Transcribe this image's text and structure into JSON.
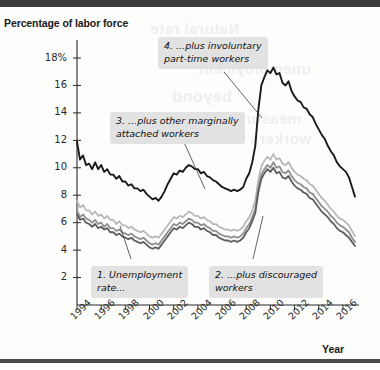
{
  "figure": {
    "y_axis_title": "Percentage of\nlabor force",
    "x_axis_title": "Year"
  },
  "annotations": [
    {
      "id": "callout-4",
      "text": "4. ...plus involuntary\npart-time workers"
    },
    {
      "id": "callout-3",
      "text": "3. ...plus other marginally\nattached workers"
    },
    {
      "id": "callout-1",
      "text": "1. Unemployment\nrate..."
    },
    {
      "id": "callout-2",
      "text": "2. ...plus discouraged\nworkers"
    }
  ],
  "chart_data": {
    "type": "line",
    "title": "",
    "subtitle": "",
    "xlabel": "Year",
    "ylabel": "Percentage of labor force",
    "xlim": [
      1994,
      2017
    ],
    "ylim": [
      0,
      19
    ],
    "yticks": [
      2,
      4,
      6,
      8,
      10,
      12,
      14,
      16,
      18
    ],
    "ytick_labels": [
      "2",
      "4",
      "6",
      "8",
      "10",
      "12",
      "14",
      "16",
      "18%"
    ],
    "xticks": [
      1994,
      1996,
      1998,
      2000,
      2002,
      2004,
      2006,
      2008,
      2010,
      2012,
      2014,
      2016
    ],
    "xtick_labels": [
      "1994",
      "1996",
      "1998",
      "2000",
      "2002",
      "2004",
      "2006",
      "2008",
      "2010",
      "2012",
      "2014",
      "2016"
    ],
    "grid": false,
    "legend": "annotations",
    "colors": {
      "u6": "#1a1a1a",
      "u5": "#b8b8b8",
      "u4": "#8f8f8f",
      "u3": "#5d5d5d"
    },
    "series": [
      {
        "name": "4. ...plus involuntary part-time workers",
        "key": "u6",
        "color": "#1a1a1a",
        "x": [
          1994.0,
          1994.25,
          1994.5,
          1994.75,
          1995.0,
          1995.25,
          1995.5,
          1995.75,
          1996.0,
          1996.25,
          1996.5,
          1996.75,
          1997.0,
          1997.25,
          1997.5,
          1997.75,
          1998.0,
          1998.25,
          1998.5,
          1998.75,
          1999.0,
          1999.25,
          1999.5,
          1999.75,
          2000.0,
          2000.25,
          2000.5,
          2000.75,
          2001.0,
          2001.25,
          2001.5,
          2001.75,
          2002.0,
          2002.25,
          2002.5,
          2002.75,
          2003.0,
          2003.25,
          2003.5,
          2003.75,
          2004.0,
          2004.25,
          2004.5,
          2004.75,
          2005.0,
          2005.25,
          2005.5,
          2005.75,
          2006.0,
          2006.25,
          2006.5,
          2006.75,
          2007.0,
          2007.25,
          2007.5,
          2007.75,
          2008.0,
          2008.25,
          2008.5,
          2008.75,
          2009.0,
          2009.25,
          2009.5,
          2009.75,
          2010.0,
          2010.25,
          2010.5,
          2010.75,
          2011.0,
          2011.25,
          2011.5,
          2011.75,
          2012.0,
          2012.25,
          2012.5,
          2012.75,
          2013.0,
          2013.25,
          2013.5,
          2013.75,
          2014.0,
          2014.25,
          2014.5,
          2014.75,
          2015.0,
          2015.25,
          2015.5,
          2015.75,
          2016.0,
          2016.25,
          2016.5,
          2016.75,
          2017.0
        ],
        "y": [
          11.9,
          10.6,
          10.9,
          10.2,
          10.3,
          9.9,
          10.4,
          9.9,
          10.2,
          9.7,
          9.9,
          9.5,
          9.5,
          9.2,
          9.4,
          9.0,
          9.0,
          8.7,
          8.8,
          8.5,
          8.5,
          8.3,
          8.4,
          8.1,
          7.9,
          7.7,
          7.8,
          7.6,
          7.9,
          8.3,
          8.8,
          9.2,
          9.6,
          9.5,
          9.8,
          9.7,
          10.0,
          10.2,
          10.1,
          9.9,
          9.9,
          9.6,
          9.7,
          9.4,
          9.3,
          9.1,
          9.0,
          8.8,
          8.6,
          8.5,
          8.4,
          8.3,
          8.4,
          8.3,
          8.4,
          8.6,
          9.2,
          9.6,
          10.4,
          11.6,
          14.2,
          16.0,
          16.6,
          17.1,
          16.9,
          17.3,
          16.8,
          16.9,
          16.2,
          16.0,
          16.3,
          15.6,
          15.2,
          14.9,
          14.8,
          14.4,
          14.3,
          13.9,
          13.7,
          13.2,
          12.8,
          12.4,
          12.1,
          11.6,
          11.2,
          10.9,
          10.4,
          10.1,
          9.9,
          9.7,
          9.3,
          8.6,
          7.9
        ]
      },
      {
        "name": "3. ...plus other marginally attached workers",
        "key": "u5",
        "color": "#b8b8b8",
        "x": [
          1994.0,
          1994.25,
          1994.5,
          1994.75,
          1995.0,
          1995.25,
          1995.5,
          1995.75,
          1996.0,
          1996.25,
          1996.5,
          1996.75,
          1997.0,
          1997.25,
          1997.5,
          1997.75,
          1998.0,
          1998.25,
          1998.5,
          1998.75,
          1999.0,
          1999.25,
          1999.5,
          1999.75,
          2000.0,
          2000.25,
          2000.5,
          2000.75,
          2001.0,
          2001.25,
          2001.5,
          2001.75,
          2002.0,
          2002.25,
          2002.5,
          2002.75,
          2003.0,
          2003.25,
          2003.5,
          2003.75,
          2004.0,
          2004.25,
          2004.5,
          2004.75,
          2005.0,
          2005.25,
          2005.5,
          2005.75,
          2006.0,
          2006.25,
          2006.5,
          2006.75,
          2007.0,
          2007.25,
          2007.5,
          2007.75,
          2008.0,
          2008.25,
          2008.5,
          2008.75,
          2009.0,
          2009.25,
          2009.5,
          2009.75,
          2010.0,
          2010.25,
          2010.5,
          2010.75,
          2011.0,
          2011.25,
          2011.5,
          2011.75,
          2012.0,
          2012.25,
          2012.5,
          2012.75,
          2013.0,
          2013.25,
          2013.5,
          2013.75,
          2014.0,
          2014.25,
          2014.5,
          2014.75,
          2015.0,
          2015.25,
          2015.5,
          2015.75,
          2016.0,
          2016.25,
          2016.5,
          2016.75,
          2017.0
        ],
        "y": [
          7.6,
          7.1,
          7.3,
          6.9,
          6.9,
          6.6,
          6.8,
          6.5,
          6.6,
          6.3,
          6.5,
          6.2,
          6.2,
          5.9,
          6.1,
          5.8,
          5.8,
          5.6,
          5.7,
          5.5,
          5.4,
          5.3,
          5.4,
          5.2,
          5.0,
          4.9,
          5.0,
          4.9,
          5.2,
          5.5,
          5.8,
          6.1,
          6.4,
          6.3,
          6.5,
          6.4,
          6.6,
          6.8,
          6.7,
          6.5,
          6.5,
          6.3,
          6.4,
          6.2,
          6.1,
          5.9,
          5.9,
          5.7,
          5.6,
          5.5,
          5.5,
          5.4,
          5.5,
          5.4,
          5.5,
          5.7,
          6.1,
          6.4,
          6.9,
          7.6,
          9.1,
          10.1,
          10.5,
          10.8,
          10.6,
          11.0,
          10.6,
          10.7,
          10.3,
          10.2,
          10.4,
          10.0,
          9.7,
          9.5,
          9.4,
          9.2,
          9.1,
          8.8,
          8.7,
          8.4,
          8.1,
          7.8,
          7.6,
          7.3,
          7.0,
          6.8,
          6.5,
          6.3,
          6.2,
          6.0,
          5.8,
          5.4,
          5.0
        ]
      },
      {
        "name": "2. ...plus discouraged workers",
        "key": "u4",
        "color": "#8f8f8f",
        "x": [
          1994.0,
          1994.25,
          1994.5,
          1994.75,
          1995.0,
          1995.25,
          1995.5,
          1995.75,
          1996.0,
          1996.25,
          1996.5,
          1996.75,
          1997.0,
          1997.25,
          1997.5,
          1997.75,
          1998.0,
          1998.25,
          1998.5,
          1998.75,
          1999.0,
          1999.25,
          1999.5,
          1999.75,
          2000.0,
          2000.25,
          2000.5,
          2000.75,
          2001.0,
          2001.25,
          2001.5,
          2001.75,
          2002.0,
          2002.25,
          2002.5,
          2002.75,
          2003.0,
          2003.25,
          2003.5,
          2003.75,
          2004.0,
          2004.25,
          2004.5,
          2004.75,
          2005.0,
          2005.25,
          2005.5,
          2005.75,
          2006.0,
          2006.25,
          2006.5,
          2006.75,
          2007.0,
          2007.25,
          2007.5,
          2007.75,
          2008.0,
          2008.25,
          2008.5,
          2008.75,
          2009.0,
          2009.25,
          2009.5,
          2009.75,
          2010.0,
          2010.25,
          2010.5,
          2010.75,
          2011.0,
          2011.25,
          2011.5,
          2011.75,
          2012.0,
          2012.25,
          2012.5,
          2012.75,
          2013.0,
          2013.25,
          2013.5,
          2013.75,
          2014.0,
          2014.25,
          2014.5,
          2014.75,
          2015.0,
          2015.25,
          2015.5,
          2015.75,
          2016.0,
          2016.25,
          2016.5,
          2016.75,
          2017.0
        ],
        "y": [
          6.9,
          6.4,
          6.6,
          6.3,
          6.2,
          6.0,
          6.2,
          5.9,
          6.0,
          5.7,
          5.9,
          5.6,
          5.6,
          5.4,
          5.5,
          5.3,
          5.2,
          5.1,
          5.2,
          5.0,
          4.9,
          4.8,
          4.9,
          4.7,
          4.5,
          4.4,
          4.5,
          4.4,
          4.7,
          5.0,
          5.3,
          5.6,
          5.9,
          5.8,
          6.0,
          5.9,
          6.1,
          6.3,
          6.2,
          6.0,
          6.0,
          5.8,
          5.9,
          5.7,
          5.6,
          5.4,
          5.4,
          5.2,
          5.1,
          5.0,
          5.0,
          4.9,
          5.0,
          4.9,
          5.0,
          5.2,
          5.6,
          5.9,
          6.4,
          7.0,
          8.5,
          9.5,
          9.9,
          10.2,
          10.0,
          10.4,
          10.0,
          10.1,
          9.7,
          9.6,
          9.8,
          9.4,
          9.1,
          8.9,
          8.8,
          8.6,
          8.5,
          8.2,
          8.1,
          7.8,
          7.5,
          7.2,
          7.0,
          6.8,
          6.5,
          6.3,
          6.0,
          5.8,
          5.7,
          5.5,
          5.3,
          4.9,
          4.6
        ]
      },
      {
        "name": "1. Unemployment rate...",
        "key": "u3",
        "color": "#5d5d5d",
        "x": [
          1994.0,
          1994.25,
          1994.5,
          1994.75,
          1995.0,
          1995.25,
          1995.5,
          1995.75,
          1996.0,
          1996.25,
          1996.5,
          1996.75,
          1997.0,
          1997.25,
          1997.5,
          1997.75,
          1998.0,
          1998.25,
          1998.5,
          1998.75,
          1999.0,
          1999.25,
          1999.5,
          1999.75,
          2000.0,
          2000.25,
          2000.5,
          2000.75,
          2001.0,
          2001.25,
          2001.5,
          2001.75,
          2002.0,
          2002.25,
          2002.5,
          2002.75,
          2003.0,
          2003.25,
          2003.5,
          2003.75,
          2004.0,
          2004.25,
          2004.5,
          2004.75,
          2005.0,
          2005.25,
          2005.5,
          2005.75,
          2006.0,
          2006.25,
          2006.5,
          2006.75,
          2007.0,
          2007.25,
          2007.5,
          2007.75,
          2008.0,
          2008.25,
          2008.5,
          2008.75,
          2009.0,
          2009.25,
          2009.5,
          2009.75,
          2010.0,
          2010.25,
          2010.5,
          2010.75,
          2011.0,
          2011.25,
          2011.5,
          2011.75,
          2012.0,
          2012.25,
          2012.5,
          2012.75,
          2013.0,
          2013.25,
          2013.5,
          2013.75,
          2014.0,
          2014.25,
          2014.5,
          2014.75,
          2015.0,
          2015.25,
          2015.5,
          2015.75,
          2016.0,
          2016.25,
          2016.5,
          2016.75,
          2017.0
        ],
        "y": [
          6.6,
          6.2,
          6.3,
          6.0,
          5.9,
          5.7,
          5.9,
          5.6,
          5.7,
          5.5,
          5.6,
          5.3,
          5.3,
          5.1,
          5.2,
          5.0,
          4.9,
          4.8,
          4.9,
          4.7,
          4.6,
          4.5,
          4.6,
          4.4,
          4.2,
          4.1,
          4.2,
          4.1,
          4.4,
          4.7,
          5.0,
          5.3,
          5.6,
          5.5,
          5.7,
          5.6,
          5.8,
          6.0,
          5.9,
          5.7,
          5.7,
          5.5,
          5.6,
          5.4,
          5.3,
          5.1,
          5.1,
          4.9,
          4.8,
          4.7,
          4.7,
          4.6,
          4.7,
          4.6,
          4.7,
          4.9,
          5.3,
          5.6,
          6.1,
          6.7,
          8.2,
          9.2,
          9.6,
          9.9,
          9.7,
          10.0,
          9.6,
          9.7,
          9.3,
          9.2,
          9.4,
          9.0,
          8.7,
          8.5,
          8.4,
          8.2,
          8.1,
          7.8,
          7.7,
          7.4,
          7.1,
          6.8,
          6.6,
          6.4,
          6.1,
          5.9,
          5.6,
          5.4,
          5.3,
          5.1,
          4.9,
          4.6,
          4.3
        ]
      }
    ],
    "leader_lines": [
      {
        "from": "callout-4",
        "x1": 224,
        "y1": 72,
        "x2": 262,
        "y2": 118
      },
      {
        "from": "callout-3",
        "x1": 183,
        "y1": 140,
        "x2": 205,
        "y2": 189
      },
      {
        "from": "callout-1",
        "x1": 131,
        "y1": 259,
        "x2": 120,
        "y2": 226
      },
      {
        "from": "callout-2",
        "x1": 253,
        "y1": 259,
        "x2": 263,
        "y2": 216
      }
    ]
  }
}
